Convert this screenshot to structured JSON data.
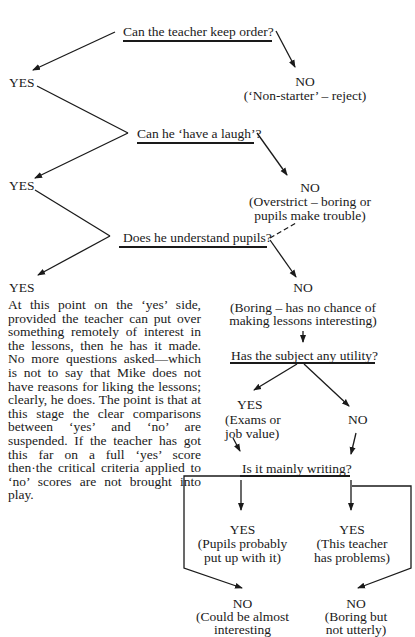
{
  "diagram": {
    "questions": [
      "Can the teacher keep order?",
      "Can he ‘have a laugh’?",
      "Does he understand pupils?",
      "Has the subject any utility?",
      "Is it mainly writing?"
    ],
    "yes_labels": [
      "YES",
      "YES",
      "YES"
    ],
    "no_outcomes": [
      {
        "label": "NO",
        "note": "(‘Non-starter’ – reject)"
      },
      {
        "label": "NO",
        "note_line1": "(Overstrict – boring or",
        "note_line2": "pupils make trouble)"
      },
      {
        "label": "NO",
        "note_line1": "(Boring – has no chance of",
        "note_line2": "making lessons interesting)"
      }
    ],
    "utility_branch": {
      "yes_label": "YES",
      "yes_note_line1": "(Exams or",
      "yes_note_line2": "job value)",
      "no_label": "NO"
    },
    "writing_branch": {
      "left_yes": {
        "label": "YES",
        "note_line1": "(Pupils probably",
        "note_line2": "put up with it)"
      },
      "right_yes": {
        "label": "YES",
        "note_line1": "(This teacher",
        "note_line2": "has problems)"
      },
      "left_no": {
        "label": "NO",
        "note_line1": "(Could be almost",
        "note_line2": "interesting"
      },
      "right_no": {
        "label": "NO",
        "note_line1": "(Boring but",
        "note_line2": "not utterly)"
      }
    },
    "paragraph": "At this point on the ‘yes’ side, provided the teacher can put over something remotely of interest in the lessons, then he has it made. No more questions asked—which is not to say that Mike does not have reasons for liking the lessons; clearly, he does. The point is that at this stage the clear comparisons between ‘yes’ and ‘no’ are suspended. If the teacher has got this far on a full ‘yes’ score then·the critical criteria applied to ‘no’ scores are not brought into play."
  }
}
